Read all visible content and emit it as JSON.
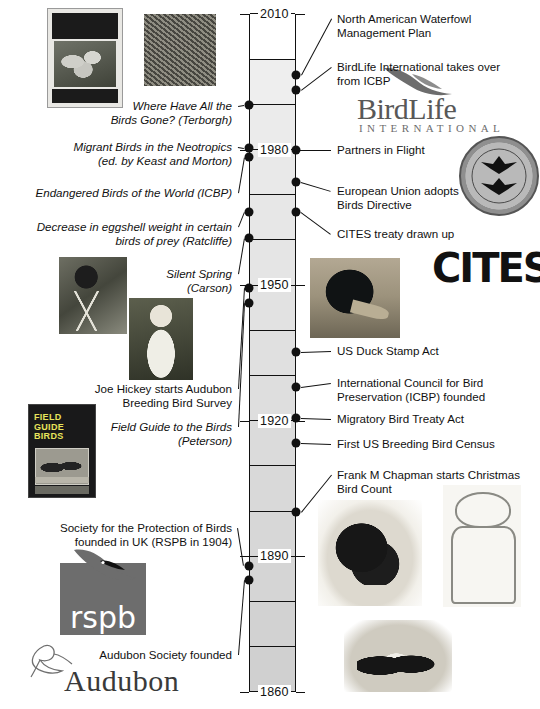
{
  "chart_data": {
    "type": "timeline",
    "axis": {
      "orientation": "vertical",
      "top_year": 2010,
      "bottom_year": 1860,
      "tick_labels": [
        "2010",
        "1980",
        "1950",
        "1920",
        "1890",
        "1860"
      ],
      "tick_years": [
        2010,
        1980,
        1950,
        1920,
        1890,
        1860
      ],
      "minor_band_interval_years": 10,
      "grid": true,
      "direction": "newest at top"
    },
    "events_right": [
      {
        "year": 1986,
        "label": "North American Waterfowl\nManagement Plan"
      },
      {
        "year": 1983,
        "label": "BirdLife International takes over\nfrom ICBP"
      },
      {
        "year": 1980,
        "label": "Partners in Flight"
      },
      {
        "year": 1971,
        "label": "European Union adopts\nBirds Directive"
      },
      {
        "year": 1963,
        "label": "CITES treaty drawn up"
      },
      {
        "year": 1934,
        "label": "US Duck Stamp Act"
      },
      {
        "year": 1922,
        "label": "International Council for Bird\nPreservation (ICBP) founded"
      },
      {
        "year": 1918,
        "label": "Migratory Bird Treaty Act"
      },
      {
        "year": 1914,
        "label": "First US Breeding Bird Census"
      },
      {
        "year": 1900,
        "label": "Frank M Chapman starts Christmas\nBird Count"
      }
    ],
    "events_left": [
      {
        "year": 1990,
        "label": "Where Have All the\nBirds Gone? (Terborgh)",
        "style": "italic"
      },
      {
        "year": 1980,
        "label": "Migrant Birds in the Neotropics\n(ed. by Keast and Morton)",
        "style": "italic"
      },
      {
        "year": 1978,
        "label": "Endangered Birds of the World (ICBP)",
        "style": "italic"
      },
      {
        "year": 1967,
        "label": "Decrease in eggshell weight in certain\nbirds of prey (Ratcliffe)",
        "style": "italic"
      },
      {
        "year": 1962,
        "label": "Silent Spring\n(Carson)",
        "style": "italic"
      },
      {
        "year": 1937,
        "label": "Joe Hickey starts Audubon\nBreeding Bird Survey",
        "style": "roman"
      },
      {
        "year": 1934,
        "label": "Field Guide to the Birds\n(Peterson)",
        "style": "italic"
      },
      {
        "year": 1889,
        "label": "Society for the Protection of Birds\nfounded in UK (RSPB in 1904)",
        "style": "roman"
      },
      {
        "year": 1886,
        "label": "Audubon Society founded",
        "style": "roman"
      }
    ]
  },
  "axis": {
    "labels": [
      {
        "text": "2010"
      },
      {
        "text": "1980"
      },
      {
        "text": "1950"
      },
      {
        "text": "1920"
      },
      {
        "text": "1890"
      },
      {
        "text": "1860"
      }
    ]
  },
  "right_events": [
    {
      "text": "North American Waterfowl\nManagement Plan"
    },
    {
      "text": "BirdLife International takes over\nfrom ICBP"
    },
    {
      "text": "Partners in Flight"
    },
    {
      "text": "European Union adopts\nBirds Directive"
    },
    {
      "text": "CITES treaty drawn up"
    },
    {
      "text": "US Duck Stamp Act"
    },
    {
      "text": "International Council for Bird\nPreservation (ICBP) founded"
    },
    {
      "text": "Migratory Bird Treaty Act"
    },
    {
      "text": "First US Breeding Bird Census"
    },
    {
      "text": "Frank M Chapman starts Christmas\nBird Count"
    }
  ],
  "left_events": [
    {
      "text": "Where Have All the\nBirds Gone? (Terborgh)"
    },
    {
      "text": "Migrant Birds in the Neotropics\n(ed. by Keast and Morton)"
    },
    {
      "text": "Endangered Birds of the World (ICBP)"
    },
    {
      "text": "Decrease in eggshell weight in certain\nbirds of prey (Ratcliffe)"
    },
    {
      "text": "Silent Spring\n(Carson)"
    },
    {
      "text": "Joe Hickey starts Audubon\nBreeding Bird Survey"
    },
    {
      "text": "Field Guide to the Birds\n(Peterson)"
    },
    {
      "text": "Society for the Protection of Birds\nfounded in UK (RSPB in 1904)"
    },
    {
      "text": "Audubon Society founded"
    }
  ],
  "logos": {
    "birdlife_name": "BirdLife",
    "birdlife_sub": "INTERNATIONAL",
    "birdlife_trademark": "®",
    "cites_text": "CITES",
    "rspb_text": "rspb",
    "audubon_text": "Audubon",
    "partners_in_flight_text": "PARTNERS IN FLIGHT"
  },
  "book_covers": {
    "where_have_all_title": "Where Have All the\nBirds Gone?",
    "where_have_all_author": "JOHN TERBORGH",
    "field_guide_line1": "FIELD",
    "field_guide_line2": "GUIDE",
    "field_guide_line3": "TO THE",
    "field_guide_line4": "BIRDS",
    "field_guide_series": "Peterson Field Guide Series"
  },
  "colors": {
    "ink": "#111111",
    "band_fill": "#d8d8d8",
    "band_fill_light": "#ededed",
    "page_bg": "#ffffff",
    "logo_gray": "#6d6d6d"
  }
}
